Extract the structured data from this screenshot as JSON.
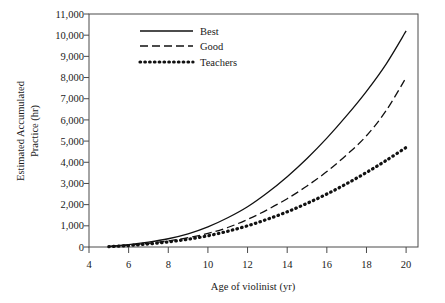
{
  "chart_data": {
    "type": "line",
    "title": "",
    "subtitle": "",
    "xlabel": "Age of violinist (yr)",
    "ylabel": "Estimated Accumulated Practice (hr)",
    "ylabel_line1": "Estimated Accumulated",
    "ylabel_line2": "Practice (hr)",
    "xlim": [
      4,
      20.6
    ],
    "ylim": [
      0,
      11000
    ],
    "grid": false,
    "legend_position": "top-center",
    "x_ticks": [
      4,
      6,
      8,
      10,
      12,
      14,
      16,
      18,
      20
    ],
    "x_tick_labels": [
      "4",
      "6",
      "8",
      "10",
      "12",
      "14",
      "16",
      "18",
      "20"
    ],
    "y_ticks": [
      0,
      1000,
      2000,
      3000,
      4000,
      5000,
      6000,
      7000,
      8000,
      9000,
      10000,
      11000
    ],
    "y_tick_labels": [
      "0",
      "1,000",
      "2,000",
      "3,000",
      "4,000",
      "5,000",
      "6,000",
      "7,000",
      "8,000",
      "9,000",
      "10,000",
      "11,000"
    ],
    "x": [
      5,
      6,
      7,
      8,
      9,
      10,
      11,
      12,
      13,
      14,
      15,
      16,
      17,
      18,
      19,
      20
    ],
    "series": [
      {
        "name": "Best",
        "style": "solid",
        "color": "#111111",
        "values": [
          30,
          110,
          230,
          390,
          620,
          950,
          1380,
          1900,
          2560,
          3320,
          4180,
          5140,
          6200,
          7350,
          8650,
          10200
        ]
      },
      {
        "name": "Good",
        "style": "dashed",
        "color": "#111111",
        "values": [
          25,
          85,
          175,
          290,
          440,
          640,
          920,
          1300,
          1760,
          2280,
          2880,
          3560,
          4350,
          5250,
          6450,
          8000
        ]
      },
      {
        "name": "Teachers",
        "style": "dotted",
        "color": "#111111",
        "values": [
          20,
          70,
          145,
          240,
          365,
          530,
          745,
          1000,
          1310,
          1660,
          2060,
          2500,
          2990,
          3520,
          4090,
          4700
        ]
      }
    ]
  },
  "legend": {
    "items": [
      {
        "label": "Best",
        "style": "solid"
      },
      {
        "label": "Good",
        "style": "dashed"
      },
      {
        "label": "Teachers",
        "style": "dotted"
      }
    ]
  }
}
